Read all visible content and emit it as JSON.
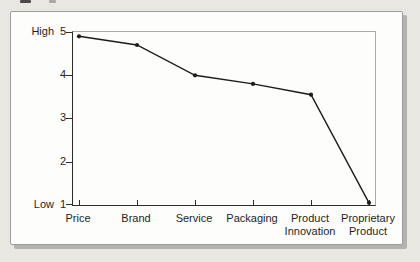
{
  "figure": {
    "y_axis": {
      "high": "High",
      "low": "Low",
      "title": "Importance of\neach criterion",
      "ticks": [
        "5",
        "4",
        "3",
        "2",
        "1"
      ]
    },
    "x_axis": {
      "labels": [
        "Price",
        "Brand",
        "Service",
        "Packaging",
        "Product\nInnovation",
        "Proprietary\nProduct"
      ]
    }
  },
  "chart_data": {
    "type": "line",
    "title": "",
    "xlabel": "",
    "ylabel": "Importance of each criterion",
    "categories": [
      "Price",
      "Brand",
      "Service",
      "Packaging",
      "Product Innovation",
      "Proprietary Product"
    ],
    "values": [
      4.9,
      4.7,
      4.0,
      3.8,
      3.55,
      1.05
    ],
    "ylim": [
      1,
      5
    ],
    "yticks": [
      1,
      2,
      3,
      4,
      5
    ],
    "y_endpoint_labels": {
      "top": "High",
      "bottom": "Low"
    },
    "grid": false,
    "legend": "none",
    "marker": "dot",
    "line_color": "#1c1c1c"
  },
  "colors": {
    "page_bg": "#e9e7e2",
    "figure_bg": "#fdfdfb",
    "frame_border": "#9c9c9c",
    "frame_shadow": "#b4b2ae",
    "axis_dark": "#2b2b2b",
    "axis_light": "#a9a9a9",
    "text": "#1f1f1f"
  }
}
